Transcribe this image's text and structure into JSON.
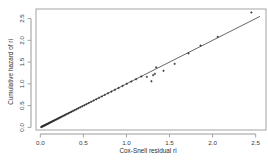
{
  "chart_data": {
    "type": "scatter",
    "title": "",
    "xlabel": "Cox-Snell residual ri",
    "ylabel": "Cumulative hazard of ri",
    "xlim": [
      -0.05,
      2.62
    ],
    "ylim": [
      -0.06,
      2.72
    ],
    "xticks": [
      0.0,
      0.5,
      1.0,
      1.5,
      2.0,
      2.5
    ],
    "xticklabels": [
      "0.0",
      "0.5",
      "1.0",
      "1.5",
      "2.0",
      "2.5"
    ],
    "yticks": [
      0.0,
      0.5,
      1.0,
      1.5,
      2.0,
      2.5
    ],
    "yticklabels": [
      "0.0",
      "0.5",
      "1.0",
      "1.5",
      "2.0",
      "2.5"
    ],
    "grid": false,
    "legend": null,
    "reference_line": {
      "name": "identity-line",
      "slope": 1.0,
      "intercept": 0.0,
      "x_start": 0.0,
      "y_start": 0.0,
      "x_end": 2.55,
      "y_end": 2.55
    },
    "series": [
      {
        "name": "Cox-Snell residuals vs Nelson-Aalen cumulative hazard",
        "marker": "plus",
        "x": [
          0.012,
          0.019,
          0.026,
          0.033,
          0.04,
          0.047,
          0.055,
          0.062,
          0.07,
          0.078,
          0.086,
          0.095,
          0.104,
          0.113,
          0.122,
          0.132,
          0.142,
          0.152,
          0.163,
          0.174,
          0.186,
          0.198,
          0.21,
          0.223,
          0.236,
          0.25,
          0.264,
          0.279,
          0.294,
          0.31,
          0.327,
          0.344,
          0.362,
          0.381,
          0.4,
          0.421,
          0.442,
          0.464,
          0.487,
          0.511,
          0.536,
          0.562,
          0.59,
          0.619,
          0.649,
          0.681,
          0.714,
          0.749,
          0.786,
          0.825,
          0.866,
          0.909,
          0.955,
          1.004,
          1.056,
          1.112,
          1.172,
          1.237,
          1.29,
          1.31,
          1.33,
          1.345,
          1.43,
          1.56,
          1.72,
          1.86,
          2.06,
          2.45
        ],
        "y": [
          0.01,
          0.018,
          0.024,
          0.03,
          0.038,
          0.044,
          0.052,
          0.06,
          0.068,
          0.075,
          0.083,
          0.092,
          0.101,
          0.11,
          0.12,
          0.129,
          0.139,
          0.15,
          0.16,
          0.172,
          0.183,
          0.195,
          0.208,
          0.22,
          0.234,
          0.247,
          0.262,
          0.276,
          0.292,
          0.308,
          0.324,
          0.342,
          0.36,
          0.378,
          0.398,
          0.418,
          0.44,
          0.462,
          0.485,
          0.508,
          0.533,
          0.56,
          0.587,
          0.616,
          0.646,
          0.678,
          0.711,
          0.746,
          0.783,
          0.822,
          0.863,
          0.906,
          0.952,
          1.001,
          1.053,
          1.108,
          1.168,
          1.16,
          1.06,
          1.2,
          1.23,
          1.38,
          1.3,
          1.46,
          1.7,
          1.88,
          2.08,
          2.64
        ]
      }
    ]
  }
}
